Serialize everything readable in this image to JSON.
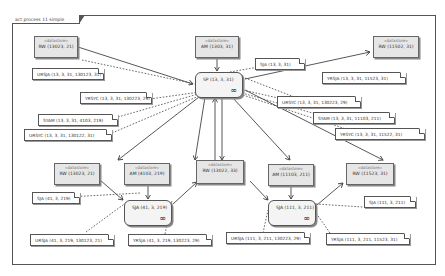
{
  "frame": {
    "title": "act process 11 simple"
  },
  "datastores": [
    {
      "id": "ds_tl",
      "stereotype": "«datastore»",
      "label": "RW (13023, 21)"
    },
    {
      "id": "ds_tc",
      "stereotype": "«datastore»",
      "label": "AM (1303, 31)"
    },
    {
      "id": "ds_tr",
      "stereotype": "«datastore»",
      "label": "RW (11502, 31)"
    },
    {
      "id": "ds_ml",
      "stereotype": "«datastore»",
      "label": "RW (13023, 21)"
    },
    {
      "id": "ds_mlc",
      "stereotype": "«datastore»",
      "label": "AM (4103, 219)"
    },
    {
      "id": "ds_mc",
      "stereotype": "«datastore»",
      "label": "RW (13022, 33)"
    },
    {
      "id": "ds_mrc",
      "stereotype": "«datastore»",
      "label": "AM (11103, 211)"
    },
    {
      "id": "ds_mr",
      "stereotype": "«datastore»",
      "label": "RW (11523, 31)"
    }
  ],
  "processes": [
    {
      "id": "p_sp",
      "label": "SP (13, 3, 31)",
      "icon": "infinity-icon"
    },
    {
      "id": "p_sja1",
      "label": "SJA (41, 3, 219)",
      "icon": "infinity-icon"
    },
    {
      "id": "p_sja2",
      "label": "SJA (111, 3, 211)",
      "icon": "infinity-icon"
    }
  ],
  "notes": [
    {
      "id": "n1",
      "text": "SJA (13, 3, 31)"
    },
    {
      "id": "n2",
      "text": "URSJA (13, 3, 31, 130123, 31)"
    },
    {
      "id": "n3",
      "text": "YRSJA (13, 3, 31, 11523, 31)"
    },
    {
      "id": "n4",
      "text": "YRSYC (13, 3, 31, 130223, 29)"
    },
    {
      "id": "n5",
      "text": "URSYC (13, 3, 31, 130223, 29)"
    },
    {
      "id": "n6",
      "text": "SYAM (13, 3, 31, 4103, 219)"
    },
    {
      "id": "n7",
      "text": "SYAM (13, 3, 31, 11103, 211)"
    },
    {
      "id": "n8",
      "text": "URSYC (13, 3, 31, 130122, 31)"
    },
    {
      "id": "n9",
      "text": "YRSYC (13, 3, 31, 11522, 31)"
    },
    {
      "id": "n10",
      "text": "SJA (41, 3, 219)"
    },
    {
      "id": "n11",
      "text": "SJA (111, 3, 211)"
    },
    {
      "id": "n12",
      "text": "URSJA (41, 3, 219, 130123, 21)"
    },
    {
      "id": "n13",
      "text": "YRSJA (41, 3, 219, 130223, 29)"
    },
    {
      "id": "n14",
      "text": "URSJA (111, 3, 211, 130223, 29)"
    },
    {
      "id": "n15",
      "text": "YRSJA (111, 3, 211, 11523, 31)"
    }
  ]
}
